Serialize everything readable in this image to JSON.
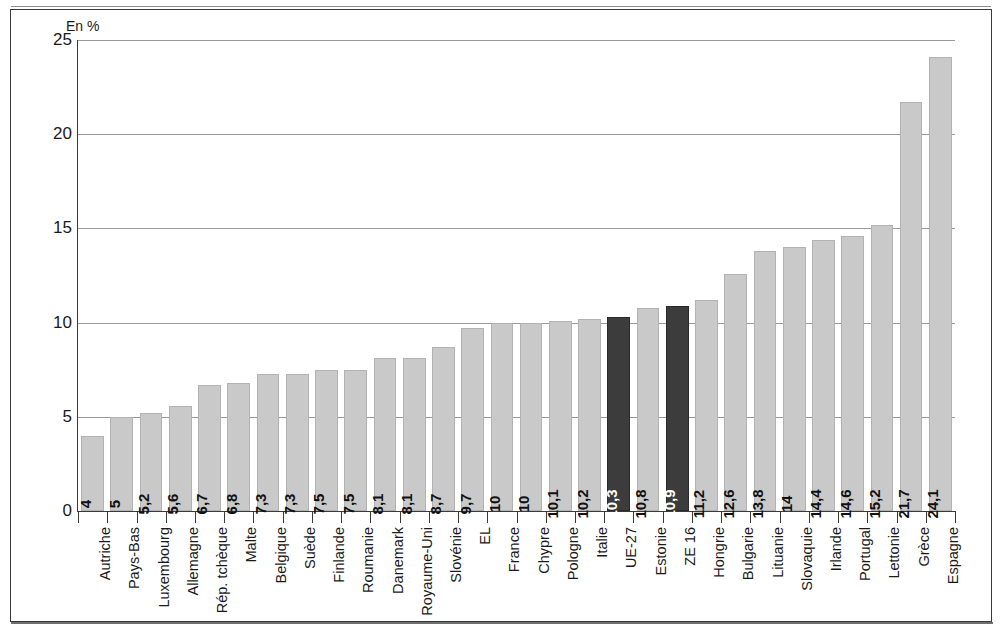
{
  "chart_data": {
    "type": "bar",
    "title": "",
    "xlabel": "",
    "ylabel": "",
    "unit_label": "En %",
    "ylim": [
      0,
      25
    ],
    "yticks": [
      0,
      5,
      10,
      15,
      20,
      25
    ],
    "ytick_labels": [
      "0",
      "5",
      "10",
      "15",
      "20",
      "25"
    ],
    "grid": true,
    "legend": "none",
    "categories": [
      "Autriche",
      "Pays-Bas",
      "Luxembourg",
      "Allemagne",
      "Rép. tchèque",
      "Malte",
      "Belgique",
      "Suède",
      "Finlande",
      "Roumanie",
      "Danemark",
      "Royaume-Uni",
      "Slovénie",
      "EL",
      "France",
      "Chypre",
      "Pologne",
      "Italie",
      "UE-27",
      "Estonie",
      "ZE 16",
      "Hongrie",
      "Bulgarie",
      "Lituanie",
      "Slovaquie",
      "Irlande",
      "Portugal",
      "Lettonie",
      "Grèce",
      "Espagne"
    ],
    "values": [
      4,
      5,
      5.2,
      5.6,
      6.7,
      6.8,
      7.3,
      7.3,
      7.5,
      7.5,
      8.1,
      8.1,
      8.7,
      9.7,
      10,
      10,
      10.1,
      10.2,
      10.3,
      10.8,
      10.9,
      11.2,
      12.6,
      13.8,
      14,
      14.4,
      14.6,
      15.2,
      21.7,
      24.1
    ],
    "value_labels": [
      "4",
      "5",
      "5,2",
      "5,6",
      "6,7",
      "6,8",
      "7,3",
      "7,3",
      "7,5",
      "7,5",
      "8,1",
      "8,1",
      "8,7",
      "9,7",
      "10",
      "10",
      "10,1",
      "10,2",
      "10,3",
      "10,8",
      "10,9",
      "11,2",
      "12,6",
      "13,8",
      "14",
      "14,4",
      "14,6",
      "15,2",
      "21,7",
      "24,1"
    ],
    "highlighted": [
      "UE-27",
      "ZE 16"
    ],
    "colors": {
      "bar_default": "#c9c9c9",
      "bar_highlight": "#3c3c3c",
      "bar_default_label": "#111111",
      "bar_highlight_label": "#ffffff",
      "gridline": "#9a9a9a",
      "axis": "#3a3a3a",
      "background": "#ffffff"
    }
  }
}
